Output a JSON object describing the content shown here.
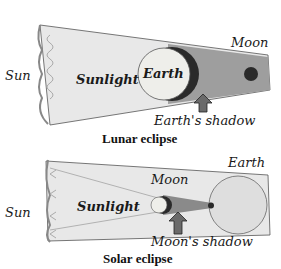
{
  "lunar": {
    "title": "Lunar eclipse",
    "labels": {
      "sun": "Sun",
      "sunlight": "Sunlight",
      "earth": "Earth",
      "moon": "Moon",
      "shadow": "Earth's shadow"
    }
  },
  "solar": {
    "title": "Solar eclipse",
    "labels": {
      "sun": "Sun",
      "sunlight": "Sunlight",
      "moon": "Moon",
      "earth": "Earth",
      "shadow": "Moon's shadow"
    }
  },
  "colors": {
    "sunlight_fill": "#e6e6e6",
    "shadow_fill": "#9a9a9a",
    "umbra": "#2a2a2a",
    "arrow": "#6a6a6a",
    "text": "#1a1a1a"
  }
}
